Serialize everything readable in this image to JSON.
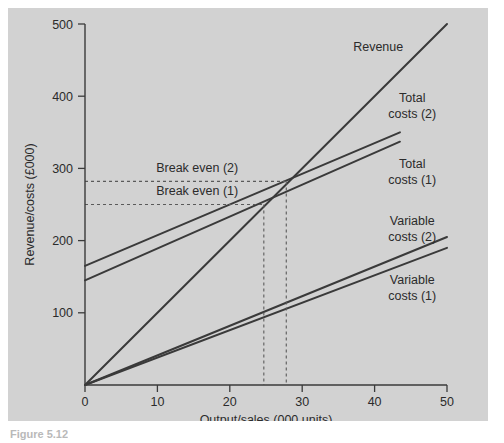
{
  "figure": {
    "caption": "Figure 5.12",
    "background_color": "#d2d2d2",
    "line_color": "#3a3a3a"
  },
  "chart_data": {
    "type": "line",
    "title": "",
    "xlabel": "Output/sales (000 units)",
    "ylabel": "Revenue/costs (£000)",
    "xlim": [
      0,
      50
    ],
    "ylim": [
      0,
      500
    ],
    "xticks": [
      0,
      10,
      20,
      30,
      40,
      50
    ],
    "xtick_labels": [
      "0",
      "10",
      "20",
      "30",
      "40",
      "50"
    ],
    "yticks": [
      100,
      200,
      300,
      400,
      500
    ],
    "ytick_labels": [
      "100",
      "200",
      "300",
      "400",
      "500"
    ],
    "grid": false,
    "legend_position": "inline-right-labels",
    "series": [
      {
        "name": "Revenue",
        "label": "Revenue",
        "x": [
          0,
          50
        ],
        "values": [
          0,
          500
        ],
        "label_x": 40.5,
        "label_y": 462
      },
      {
        "name": "Total costs (2)",
        "label": "Total\ncosts (2)",
        "label_line1": "Total",
        "label_line2": "costs (2)",
        "x": [
          0,
          43.5
        ],
        "values": [
          165,
          350
        ],
        "label_x": 45.2,
        "label_y": 392
      },
      {
        "name": "Total costs (1)",
        "label": "Total\ncosts (1)",
        "label_line1": "Total",
        "label_line2": "costs (1)",
        "x": [
          0,
          43.5
        ],
        "values": [
          145,
          337
        ],
        "label_x": 45.2,
        "label_y": 300
      },
      {
        "name": "Variable costs (2)",
        "label": "Variable\ncosts (2)",
        "label_line1": "Variable",
        "label_line2": "costs (2)",
        "x": [
          0,
          50
        ],
        "values": [
          0,
          205
        ],
        "label_x": 45.2,
        "label_y": 222
      },
      {
        "name": "Variable costs (1)",
        "label": "Variable\ncosts (1)",
        "label_line1": "Variable",
        "label_line2": "costs (1)",
        "x": [
          0,
          50
        ],
        "values": [
          0,
          190
        ],
        "label_x": 45.2,
        "label_y": 140
      }
    ],
    "annotations": [
      {
        "name": "break-even-2",
        "text": "Break even (2)",
        "y_value": 282,
        "x_value": 27.8,
        "text_x": 15.5,
        "text_y": 295
      },
      {
        "name": "break-even-1",
        "text": "Break even (1)",
        "y_value": 250,
        "x_value": 24.7,
        "text_x": 15.5,
        "text_y": 263
      }
    ]
  }
}
